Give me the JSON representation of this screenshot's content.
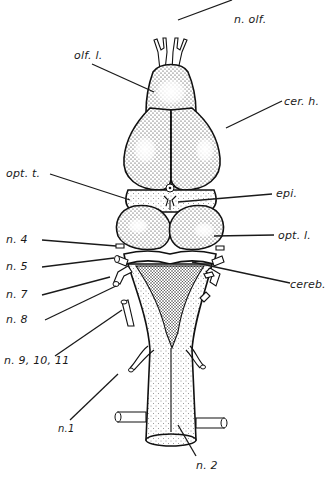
{
  "figure": {
    "labels": {
      "n_olf": "n. olf.",
      "olf_l": "olf. l.",
      "cer_h": "cer. h.",
      "opt_t": "opt. t.",
      "epi": "epi.",
      "n4": "n. 4",
      "opt_l": "opt. l.",
      "n5": "n. 5",
      "cereb": "cereb.",
      "n7": "n. 7",
      "n8": "n. 8",
      "n9_10_11": "n. 9, 10, 11",
      "n1": "n.1",
      "n2": "n. 2"
    },
    "colors": {
      "ink": "#111111",
      "paper": "#ffffff"
    }
  }
}
